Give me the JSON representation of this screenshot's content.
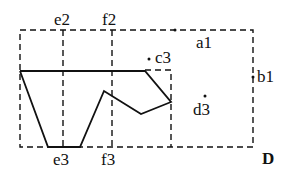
{
  "diagram": {
    "title_label": "D",
    "colors": {
      "stroke": "#111111",
      "background": "#ffffff"
    },
    "outer_rect": {
      "x1": 20,
      "y1": 30,
      "x2": 253,
      "y2": 147,
      "style": "dashed"
    },
    "inner_rect": {
      "x1": 112,
      "y1": 70,
      "x2": 171,
      "y2": 147,
      "style": "dashed"
    },
    "vertical_lines": [
      {
        "name": "e",
        "x": 63,
        "y1": 30,
        "y2": 147,
        "style": "dashed"
      },
      {
        "name": "f",
        "x": 112,
        "y1": 30,
        "y2": 147,
        "style": "dashed"
      }
    ],
    "solid_polygon": {
      "points": [
        [
          20,
          71
        ],
        [
          145,
          71
        ],
        [
          171,
          102
        ],
        [
          141,
          114
        ],
        [
          104,
          91
        ],
        [
          80,
          147
        ],
        [
          48,
          147
        ],
        [
          20,
          71
        ]
      ]
    },
    "points": [
      {
        "label": "a1",
        "x": 175,
        "y": 30
      },
      {
        "label": "b1",
        "x": 253,
        "y": 77
      },
      {
        "label": "c3",
        "x": 150,
        "y": 60
      },
      {
        "label": "d3",
        "x": 206,
        "y": 97
      },
      {
        "label": "e2",
        "x": 63,
        "y": 30
      },
      {
        "label": "f2",
        "x": 112,
        "y": 30
      },
      {
        "label": "e3",
        "x": 63,
        "y": 147
      },
      {
        "label": "f3",
        "x": 112,
        "y": 147
      }
    ],
    "labels": {
      "a1": "a1",
      "b1": "b1",
      "c3": "c3",
      "d3": "d3",
      "e2": "e2",
      "f2": "f2",
      "e3": "e3",
      "f3": "f3",
      "D": "D"
    }
  }
}
